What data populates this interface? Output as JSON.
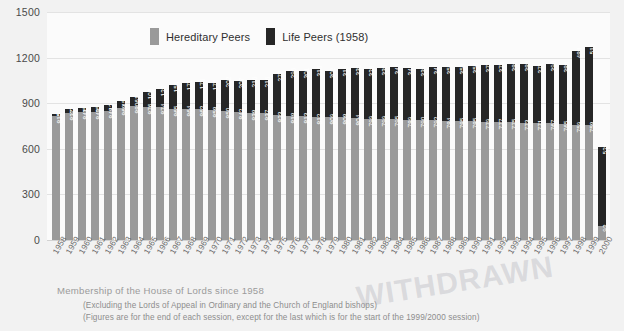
{
  "caption": {
    "title": "Membership of the House of Lords since 1958",
    "footnote_1": "(Excluding the Lords of Appeal in Ordinary and the Church of England bishops)",
    "footnote_2": "(Figures are for the end of each session, except for the last which is for the start of the 1999/2000 session)"
  },
  "watermark": {
    "text": "WITHDRAWN"
  },
  "legend": {
    "items": [
      {
        "label": "Hereditary Peers",
        "color": "#9a9a9a"
      },
      {
        "label": "Life Peers (1958)",
        "color": "#262626"
      }
    ]
  },
  "colors": {
    "hereditary": "#9a9a9a",
    "life": "#262626",
    "background": "#f2f2f2",
    "plot_background": "#fbfbfb",
    "gridline": "#e3e3e3",
    "axis_text": "#4a4a4a",
    "caption_text": "#9b9b9b"
  },
  "chart_data": {
    "type": "bar",
    "stacked": true,
    "title": "Membership of the House of Lords since 1958",
    "xlabel": "",
    "ylabel": "",
    "ylim": [
      0,
      1500
    ],
    "yticks": [
      0,
      300,
      600,
      900,
      1200,
      1500
    ],
    "grid": true,
    "legend_position": "top-center",
    "categories": [
      "1958",
      "1959",
      "1960",
      "1961",
      "1962",
      "1963",
      "1964",
      "1965",
      "1966",
      "1967",
      "1968",
      "1969",
      "1970",
      "1971",
      "1972",
      "1973",
      "1974",
      "1975",
      "1976",
      "1977",
      "1978",
      "1979",
      "1980",
      "1981",
      "1982",
      "1983",
      "1984",
      "1985",
      "1986",
      "1987",
      "1988",
      "1989",
      "1990",
      "1991",
      "1992",
      "1993",
      "1994",
      "1995",
      "1996",
      "1997",
      "1998",
      "1999",
      "2000"
    ],
    "series": [
      {
        "name": "Hereditary Peers",
        "color": "#9a9a9a",
        "values": [
          815,
          837,
          841,
          840,
          848,
          868,
          880,
          876,
          874,
          865,
          864,
          862,
          858,
          850,
          842,
          838,
          837,
          823,
          818,
          813,
          812,
          809,
          808,
          804,
          799,
          799,
          795,
          789,
          790,
          792,
          784,
          785,
          785,
          779,
          777,
          775,
          773,
          771,
          767,
          765,
          759,
          758,
          92
        ]
      },
      {
        "name": "Life Peers (1958)",
        "color": "#262626",
        "values": [
          15,
          22,
          25,
          35,
          42,
          45,
          61,
          100,
          120,
          154,
          171,
          176,
          178,
          202,
          207,
          216,
          216,
          272,
          295,
          301,
          316,
          302,
          319,
          330,
          328,
          335,
          345,
          340,
          334,
          346,
          353,
          353,
          358,
          372,
          373,
          386,
          383,
          371,
          390,
          388,
          484,
          515,
          522
        ]
      }
    ]
  }
}
